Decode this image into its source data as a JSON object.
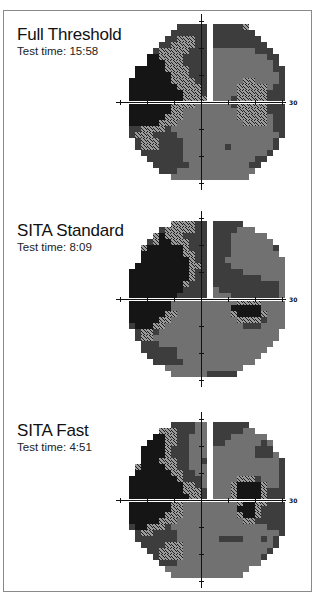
{
  "figure": {
    "panels": [
      {
        "title": "Full Threshold",
        "subtitle": "Test time: 15:58",
        "axis_label": "30",
        "rows": [
          "0000000000000000000000000000",
          "0000000000222220222223000000",
          "0000000002222220222222200000",
          "0000000022333220222222220000",
          "0000000223333220222222222000",
          "0000002333332220111111122200",
          "0000044333322220111111111220",
          "0000044433322220111111111120",
          "0004444433332220111111111122",
          "0004444443332220111111111112",
          "0044444443333220111113311112",
          "0044444444333320111133333122",
          "0044444444433320111133333222",
          "0044444444433330111233333222",
          "0044444443333111111233333222",
          "0044444443311111111133333222",
          "0044444433311111111133333122",
          "0044444333111111111113333122",
          "0022333321111111111111111122",
          "0023332222111111111111111112",
          "0002333222211111111111111120",
          "0002333222211111112111111120",
          "0000222222211111111111111200",
          "0000022222211111111111122000",
          "0000002222221111111111220000",
          "0000000222111111111111100000",
          "0000000001111111111111000000",
          "0000000000000000000000000000"
        ]
      },
      {
        "title": "SITA Standard",
        "subtitle": "Test time: 8:09",
        "axis_label": "30",
        "rows": [
          "0000000000000000000000000000",
          "0000000003333220222220000000",
          "0000000233333220222211100000",
          "0000003433322220222111111000",
          "0000023443332220222111111100",
          "0000344444432220222111111120",
          "0000444444433220222111111110",
          "0000444444443220221111111111",
          "0004444444443320222111111111",
          "0044444444443220222221111111",
          "0044444444443220222222221111",
          "0044444444432220222222222221",
          "0044444444422220122222222221",
          "0044444444222220111222222221",
          "0044444441111111111133331111",
          "0044444441111111111444441111",
          "0044444433111111111344443111",
          "0044444331111111111133332111",
          "0024443311111111111112221111",
          "0002332111111111111111111110",
          "0002331111111111111111111110",
          "0000222111111111111111111100",
          "0000222222111111111111111000",
          "0000022222111111111111110000",
          "0000002222211111111111100000",
          "0000000011111111111110000000",
          "0000000001111112222200000000",
          "0000000000000000000000000000"
        ]
      },
      {
        "title": "SITA Fast",
        "subtitle": "Test time: 4:51",
        "axis_label": "30",
        "rows": [
          "0000000000000000000000000000",
          "0000000002222110222222000000",
          "0000000333222110222221100000",
          "0000004433221110222111111000",
          "0000044433221110221111112100",
          "0000444432221110111111122200",
          "0000444432221110111111122210",
          "0000444333221120111111111112",
          "0003444433221110111111111112",
          "0004444443322110111111111112",
          "0044444444322210111133321112",
          "0044444444433210111344443112",
          "0044444444433320111344443222",
          "0044444444443320111344443222",
          "0044444443311111111134433222",
          "0044444443311111111144432222",
          "0044444433311111111134432222",
          "0044444333111111111113322222",
          "0024433321111111111111111222",
          "0002332222111111111111111112",
          "0002222222111111122221112120",
          "0000222233311111111111111120",
          "0000022333311111111111111200",
          "0000002333311111111111112000",
          "0000000222111111111111110000",
          "0000000011111111111111000000",
          "0000000001111111111110000000",
          "0000000000000000000000000000"
        ]
      }
    ]
  },
  "chart_data": [
    {
      "type": "heatmap",
      "title": "Full Threshold",
      "subtitle": "Test time: 15:58",
      "test_time": "15:58",
      "xlabel": "",
      "ylabel": "",
      "axis_extent_degrees": 30,
      "tick_spacing_degrees": 10,
      "axis_label": "30",
      "legend": "greyscale sensitivity (darker = lower sensitivity)",
      "notes": "Dense superior/inferior nasal scotoma on left half (black), dark blind-spot region right of fixation near 15 degrees"
    },
    {
      "type": "heatmap",
      "title": "SITA Standard",
      "subtitle": "Test time: 8:09",
      "test_time": "8:09",
      "xlabel": "",
      "ylabel": "",
      "axis_extent_degrees": 30,
      "tick_spacing_degrees": 10,
      "axis_label": "30",
      "legend": "greyscale sensitivity (darker = lower sensitivity)",
      "notes": "Large black superior-nasal defect on left, smaller inferior-left defect, blind spot below horizontal meridian on right"
    },
    {
      "type": "heatmap",
      "title": "SITA Fast",
      "subtitle": "Test time: 4:51",
      "test_time": "4:51",
      "xlabel": "",
      "ylabel": "",
      "axis_extent_degrees": 30,
      "tick_spacing_degrees": 10,
      "axis_label": "30",
      "legend": "greyscale sensitivity (darker = lower sensitivity)",
      "notes": "Left-side black defect spanning horizontal meridian, blind spot spanning meridian on right"
    }
  ]
}
